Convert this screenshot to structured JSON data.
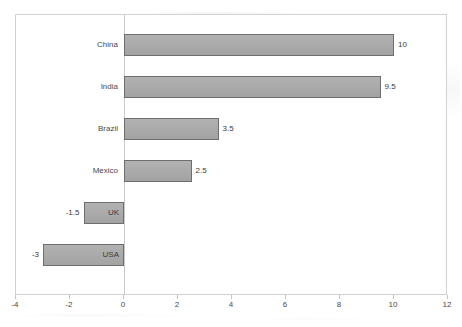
{
  "chart_data": {
    "type": "bar",
    "orientation": "horizontal",
    "title": "",
    "xlabel": "",
    "ylabel": "",
    "xlim": [
      -4,
      12
    ],
    "xticks": [
      -4,
      -2,
      0,
      2,
      4,
      6,
      8,
      10,
      12
    ],
    "xtick_labels": [
      "-4",
      "-2",
      "0",
      "2",
      "4",
      "6",
      "8",
      "10",
      "12"
    ],
    "grid": false,
    "legend": null,
    "zero_line": 0,
    "categories": [
      "China",
      "India",
      "Brazil",
      "Mexico",
      "UK",
      "USA"
    ],
    "values": [
      10,
      9.5,
      3.5,
      2.5,
      -1.5,
      -3
    ],
    "value_labels": [
      "10",
      "9.5",
      "3.5",
      "2.5",
      "-1.5",
      "-3"
    ],
    "bars": [
      {
        "category": "China",
        "value": 10,
        "value_label": "10",
        "label_placement": "outside-left"
      },
      {
        "category": "India",
        "value": 9.5,
        "value_label": "9.5",
        "label_placement": "outside-left"
      },
      {
        "category": "Brazil",
        "value": 3.5,
        "value_label": "3.5",
        "label_placement": "outside-left"
      },
      {
        "category": "Mexico",
        "value": 2.5,
        "value_label": "2.5",
        "label_placement": "outside-left"
      },
      {
        "category": "UK",
        "value": -1.5,
        "value_label": "-1.5",
        "label_placement": "inside-right"
      },
      {
        "category": "USA",
        "value": -3,
        "value_label": "-3",
        "label_placement": "inside-right"
      }
    ],
    "colors": {
      "bar_fill": "#a9a9a9",
      "bar_border": "#6e6e6e",
      "frame": "#d2d2d2",
      "zero_axis": "#c9c9c9",
      "text": "#3c3c3c",
      "background": "#ffffff"
    }
  }
}
